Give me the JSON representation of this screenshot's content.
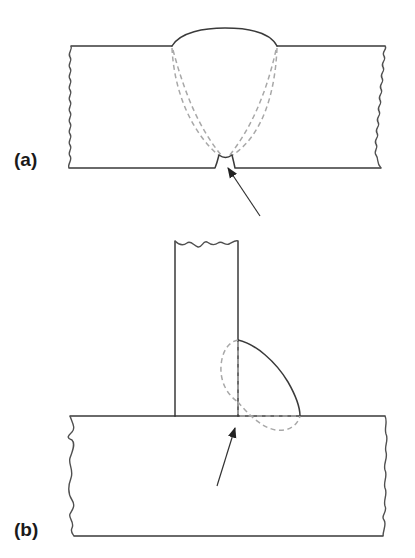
{
  "figure": {
    "panels": [
      {
        "id": "a",
        "label": "(a)",
        "description": "Butt weld cross-section with incomplete root penetration; arrow points to root gap"
      },
      {
        "id": "b",
        "label": "(b)",
        "description": "T-joint fillet weld cross-section with lack of root fusion; arrow points to weld root"
      }
    ],
    "colors": {
      "outline": "#3a3a3a",
      "fusion_boundary_dashed": "#a8a8a8",
      "arrow": "#222222",
      "background": "#ffffff"
    }
  }
}
